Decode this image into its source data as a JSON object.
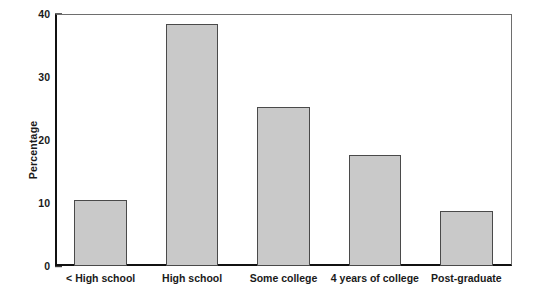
{
  "chart_data": {
    "type": "bar",
    "title": "",
    "xlabel": "",
    "ylabel": "Percentage",
    "categories": [
      "< High school",
      "High school",
      "Some college",
      "4 years of college",
      "Post-graduate"
    ],
    "values": [
      10.5,
      38.4,
      25.3,
      17.7,
      8.7
    ],
    "ylim": [
      0,
      40
    ],
    "yticks": [
      0,
      10,
      20,
      30,
      40
    ],
    "ytick_labels": [
      "0",
      "10",
      "20",
      "30",
      "40"
    ],
    "grid": false,
    "legend": false,
    "legend_position": "none",
    "bar_fill_color": "#c9c9c9",
    "bar_edge_color": "#4a4a4a",
    "axis_color": "#111111",
    "background_color": "#ffffff"
  }
}
